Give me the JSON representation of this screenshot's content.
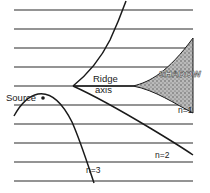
{
  "diagram": {
    "labels": {
      "source": "Source",
      "ridge_line1": "Ridge",
      "ridge_line2": "axis",
      "shadow": "SHADOW",
      "n1": "n=1",
      "n2": "n=2",
      "n3": "n=3"
    },
    "colors": {
      "line": "#1a1a1a",
      "shadow_fill": "#9a9a9a",
      "background": "#ffffff"
    },
    "horizontal_line_count": 10
  }
}
